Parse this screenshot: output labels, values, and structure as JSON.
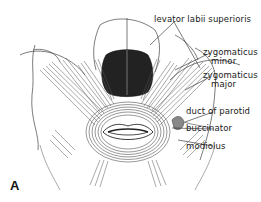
{
  "figure": {
    "panel_letter": "A",
    "labels": {
      "levator_labii_superioris": "levator labii superioris",
      "zygomaticus_minor_1": "zygomaticus",
      "zygomaticus_minor_2": "minor",
      "zygomaticus_major_1": "zygomaticus",
      "zygomaticus_major_2": "major",
      "duct_of_parotid": "duct of parotid",
      "buccinator": "buccinator",
      "modiolus": "modiolus"
    },
    "colors": {
      "ink": "#1a1a1a",
      "nasal": "#2a2a2a",
      "background": "#ffffff"
    }
  }
}
